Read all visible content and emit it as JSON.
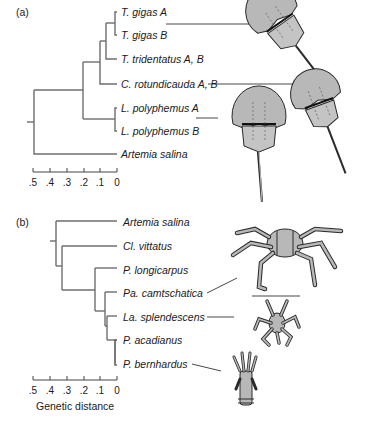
{
  "panels": [
    {
      "id": "a",
      "label": "(a)",
      "taxa": [
        "T. gigas A",
        "T. gigas B",
        "T. tridentatus A, B",
        "C. rotundicauda A, B",
        "L. polyphemus A",
        "L. polyphemus B",
        "Artemia salina"
      ],
      "scale_ticks": [
        ".5",
        ".4",
        ".3",
        ".2",
        ".1",
        "0"
      ],
      "illustrations": [
        "horseshoe-crab-tachypleus-gigas",
        "horseshoe-crab-carcinoscorpius",
        "horseshoe-crab-limulus"
      ]
    },
    {
      "id": "b",
      "label": "(b)",
      "taxa": [
        "Artemia salina",
        "Cl. vittatus",
        "P. longicarpus",
        "Pa. camtschatica",
        "La. splendescens",
        "P. acadianus",
        "P. bernhardus"
      ],
      "scale_ticks": [
        ".5",
        ".4",
        ".3",
        ".2",
        ".1",
        "0"
      ],
      "axis_title": "Genetic distance",
      "illustrations": [
        "king-crab-paralithodes",
        "lomis-lithodid-crab",
        "hermit-crab-pagurus"
      ]
    }
  ],
  "colors": {
    "branch": "#6e6e6e",
    "illustration_fill": "#b8b8b8",
    "illustration_stroke": "#2a2a2a"
  }
}
